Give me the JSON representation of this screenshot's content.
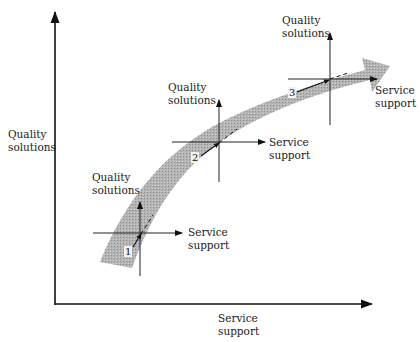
{
  "diagram": {
    "axes": {
      "y_label_line1": "Quality",
      "y_label_line2": "solutions",
      "x_label_line1": "Service",
      "x_label_line2": "support"
    },
    "band": {
      "description": "curved progression arrow",
      "color": "#a8a8a8"
    },
    "stages": [
      {
        "number": "1",
        "q_line1": "Quality",
        "q_line2": "solutions",
        "s_line1": "Service",
        "s_line2": "support"
      },
      {
        "number": "2",
        "q_line1": "Quality",
        "q_line2": "solutions",
        "s_line1": "Service",
        "s_line2": "support"
      },
      {
        "number": "3",
        "q_line1": "Quality",
        "q_line2": "solutions",
        "s_line1": "Service",
        "s_line2": "support"
      }
    ]
  }
}
